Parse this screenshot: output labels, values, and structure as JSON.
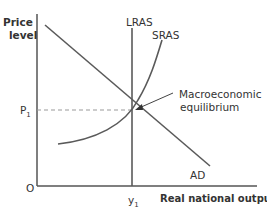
{
  "diagram": {
    "title": "",
    "y_axis_label_line1": "Price",
    "y_axis_label_line2": "level",
    "x_axis_label": "Real national output",
    "origin_label": "O",
    "price_label": "P",
    "price_sub": "1",
    "output_label": "y",
    "output_sub": "1",
    "curves": {
      "lras": "LRAS",
      "sras": "SRAS",
      "ad": "AD"
    },
    "annotation_line1": "Macroeconomic",
    "annotation_line2": "equilibrium",
    "colors": {
      "axis": "#555555",
      "curve": "#5a5a5a",
      "dashed": "#888888",
      "text": "#333333"
    }
  }
}
